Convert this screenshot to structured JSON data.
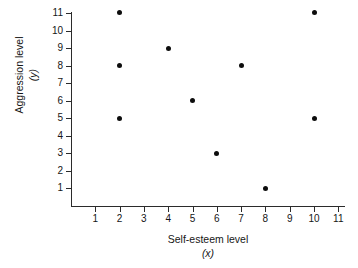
{
  "chart_data": {
    "type": "scatter",
    "title": "",
    "xlabel": "Self-esteem level",
    "xlabel_var": "(x)",
    "ylabel": "Aggression level",
    "ylabel_var": "(y)",
    "xlim": [
      0,
      11.5
    ],
    "ylim": [
      0,
      11.5
    ],
    "xticks": [
      1,
      2,
      3,
      4,
      5,
      6,
      7,
      8,
      9,
      10,
      11
    ],
    "yticks": [
      1,
      2,
      3,
      4,
      5,
      6,
      7,
      8,
      9,
      10,
      11
    ],
    "grid": false,
    "legend": null,
    "marker_color": "#0d0d0d",
    "axis_color": "#2b2b2b",
    "points": [
      {
        "x": 2,
        "y": 11
      },
      {
        "x": 2,
        "y": 8
      },
      {
        "x": 2,
        "y": 5
      },
      {
        "x": 4,
        "y": 9
      },
      {
        "x": 5,
        "y": 6
      },
      {
        "x": 6,
        "y": 3
      },
      {
        "x": 7,
        "y": 8
      },
      {
        "x": 8,
        "y": 1
      },
      {
        "x": 10,
        "y": 11
      },
      {
        "x": 10,
        "y": 5
      }
    ]
  }
}
